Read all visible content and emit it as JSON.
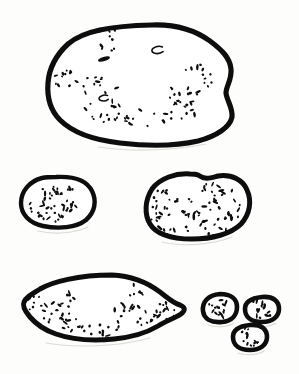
{
  "figure": {
    "background_color": "#fdfdfc",
    "ink_color": "#0d0d0d",
    "fill_color": "#ffffff",
    "shadow_color": "#dedad6",
    "canvas": {
      "width": 299,
      "height": 374
    },
    "rows": [
      {
        "name": "row-top",
        "object_count": 1
      },
      {
        "name": "row-middle",
        "object_count": 2
      },
      {
        "name": "row-bottom",
        "object_count": 4
      }
    ],
    "objects": [
      {
        "id": "object-1",
        "name": "large-rounded-cobble",
        "row": "row-top",
        "stroke_width": 5.2,
        "bbox": {
          "x": 46,
          "y": 22,
          "width": 189,
          "height": 124
        },
        "outline": "M 152 25 C 178 24 196 31 210 41 C 222 50 230 58 231 69 C 232 80 226 86 226 93 C 227 101 233 108 232 117 C 230 127 217 136 198 141 C 176 146 146 146 120 143 C 94 140 72 132 60 120 C 49 109 47 96 48 83 C 49 69 55 56 68 44 C 83 31 110 26 152 25 Z",
        "shadow": "M 98 147 C 130 152 172 151 206 144",
        "pits": [
          {
            "cx": 104,
            "cy": 59,
            "rx": 6.2,
            "ry": 2.1,
            "rot": -16
          },
          {
            "cx": 158,
            "cy": 50,
            "rx": 6.4,
            "ry": 3.4,
            "rot": -8,
            "open": true
          },
          {
            "cx": 104,
            "cy": 98,
            "rx": 5.2,
            "ry": 2.8,
            "rot": -10,
            "open": true
          }
        ],
        "stipple_clusters": [
          {
            "cx": 110,
            "cy": 40,
            "spread_x": 14,
            "spread_y": 12,
            "count": 9,
            "seed": 11
          },
          {
            "cx": 66,
            "cy": 80,
            "spread_x": 12,
            "spread_y": 11,
            "count": 12,
            "seed": 23
          },
          {
            "cx": 96,
            "cy": 85,
            "spread_x": 22,
            "spread_y": 9,
            "count": 11,
            "seed": 37
          },
          {
            "cx": 106,
            "cy": 112,
            "spread_x": 22,
            "spread_y": 12,
            "count": 16,
            "seed": 41
          },
          {
            "cx": 148,
            "cy": 118,
            "spread_x": 24,
            "spread_y": 9,
            "count": 14,
            "seed": 53
          },
          {
            "cx": 186,
            "cy": 110,
            "spread_x": 20,
            "spread_y": 10,
            "count": 13,
            "seed": 67
          },
          {
            "cx": 196,
            "cy": 80,
            "spread_x": 16,
            "spread_y": 16,
            "count": 18,
            "seed": 79
          },
          {
            "cx": 176,
            "cy": 96,
            "spread_x": 12,
            "spread_y": 10,
            "count": 7,
            "seed": 89
          }
        ]
      },
      {
        "id": "object-2",
        "name": "small-oval-left",
        "row": "row-middle",
        "stroke_width": 4.4,
        "bbox": {
          "x": 18,
          "y": 174,
          "width": 78,
          "height": 55
        },
        "outline": "M 56 177 C 74 176 87 181 92 191 C 97 201 95 212 86 220 C 76 228 58 229 43 226 C 29 223 21 214 21 203 C 21 191 30 181 42 178 C 47 177 51 177 56 177 Z",
        "shadow": "M 38 231 C 55 235 75 233 88 227",
        "pits": [],
        "stipple_clusters": [
          {
            "cx": 44,
            "cy": 193,
            "spread_x": 14,
            "spread_y": 7,
            "count": 10,
            "seed": 5
          },
          {
            "cx": 62,
            "cy": 191,
            "spread_x": 12,
            "spread_y": 6,
            "count": 7,
            "seed": 13
          },
          {
            "cx": 42,
            "cy": 208,
            "spread_x": 15,
            "spread_y": 9,
            "count": 13,
            "seed": 29
          },
          {
            "cx": 68,
            "cy": 205,
            "spread_x": 16,
            "spread_y": 10,
            "count": 11,
            "seed": 43
          },
          {
            "cx": 56,
            "cy": 217,
            "spread_x": 16,
            "spread_y": 6,
            "count": 8,
            "seed": 61
          }
        ]
      },
      {
        "id": "object-3",
        "name": "medium-oval-right",
        "row": "row-middle",
        "stroke_width": 5.0,
        "bbox": {
          "x": 143,
          "y": 171,
          "width": 110,
          "height": 72
        },
        "outline": "M 198 175 C 205 180 210 178 218 176 C 232 174 243 180 247 190 C 252 201 250 214 241 224 C 231 234 212 239 192 239 C 172 239 156 234 150 224 C 144 214 145 200 152 189 C 160 178 176 173 190 174 C 194 174 196 174 198 175 Z",
        "shadow": "M 162 242 C 182 247 212 245 232 237",
        "pits": [],
        "stipple_clusters": [
          {
            "cx": 167,
            "cy": 196,
            "spread_x": 14,
            "spread_y": 9,
            "count": 8,
            "seed": 7
          },
          {
            "cx": 158,
            "cy": 212,
            "spread_x": 10,
            "spread_y": 12,
            "count": 9,
            "seed": 17
          },
          {
            "cx": 180,
            "cy": 208,
            "spread_x": 16,
            "spread_y": 12,
            "count": 11,
            "seed": 31
          },
          {
            "cx": 172,
            "cy": 230,
            "spread_x": 16,
            "spread_y": 8,
            "count": 12,
            "seed": 47
          },
          {
            "cx": 216,
            "cy": 192,
            "spread_x": 18,
            "spread_y": 10,
            "count": 14,
            "seed": 59
          },
          {
            "cx": 222,
            "cy": 210,
            "spread_x": 20,
            "spread_y": 13,
            "count": 19,
            "seed": 71
          },
          {
            "cx": 212,
            "cy": 228,
            "spread_x": 16,
            "spread_y": 8,
            "count": 11,
            "seed": 83
          },
          {
            "cx": 196,
            "cy": 218,
            "spread_x": 12,
            "spread_y": 10,
            "count": 7,
            "seed": 97
          }
        ]
      },
      {
        "id": "object-4",
        "name": "elongated-flake",
        "row": "row-bottom",
        "stroke_width": 5.0,
        "bbox": {
          "x": 20,
          "y": 272,
          "width": 168,
          "height": 72
        },
        "outline": "M 112 275 C 134 276 148 283 160 292 C 168 298 173 303 180 305 C 185 307 186 310 181 314 C 175 318 166 321 158 326 C 148 332 134 337 114 339 C 92 341 70 339 56 334 C 44 330 36 324 30 317 C 25 311 22 306 24 302 C 26 297 32 294 40 289 C 52 282 78 275 112 275 Z",
        "shadow": "M 46 343 C 74 348 118 347 150 338",
        "pits": [],
        "stipple_clusters": [
          {
            "cx": 34,
            "cy": 303,
            "spread_x": 9,
            "spread_y": 10,
            "count": 9,
            "seed": 3
          },
          {
            "cx": 52,
            "cy": 312,
            "spread_x": 14,
            "spread_y": 11,
            "count": 12,
            "seed": 19
          },
          {
            "cx": 70,
            "cy": 325,
            "spread_x": 14,
            "spread_y": 8,
            "count": 10,
            "seed": 33
          },
          {
            "cx": 68,
            "cy": 306,
            "spread_x": 9,
            "spread_y": 14,
            "count": 9,
            "seed": 51
          },
          {
            "cx": 100,
            "cy": 330,
            "spread_x": 16,
            "spread_y": 7,
            "count": 10,
            "seed": 63
          },
          {
            "cx": 122,
            "cy": 318,
            "spread_x": 9,
            "spread_y": 16,
            "count": 11,
            "seed": 73
          },
          {
            "cx": 136,
            "cy": 296,
            "spread_x": 7,
            "spread_y": 16,
            "count": 10,
            "seed": 87
          },
          {
            "cx": 146,
            "cy": 320,
            "spread_x": 11,
            "spread_y": 11,
            "count": 10,
            "seed": 101
          },
          {
            "cx": 166,
            "cy": 310,
            "spread_x": 10,
            "spread_y": 11,
            "count": 13,
            "seed": 107
          }
        ]
      },
      {
        "id": "object-5",
        "name": "tiny-round-left",
        "row": "row-bottom",
        "stroke_width": 4.6,
        "bbox": {
          "x": 200,
          "y": 291,
          "width": 40,
          "height": 34
        },
        "outline": "M 220 294 C 231 294 237 299 237 307 C 237 315 232 321 222 322 C 211 323 204 319 203 311 C 202 302 208 295 220 294 Z",
        "shadow": "M 208 325 C 216 328 228 327 234 323",
        "pits": [],
        "stipple_clusters": [
          {
            "cx": 218,
            "cy": 303,
            "spread_x": 9,
            "spread_y": 6,
            "count": 8,
            "seed": 9
          },
          {
            "cx": 218,
            "cy": 313,
            "spread_x": 9,
            "spread_y": 6,
            "count": 9,
            "seed": 27
          }
        ]
      },
      {
        "id": "object-6",
        "name": "tiny-round-upper-right",
        "row": "row-bottom",
        "stroke_width": 4.6,
        "bbox": {
          "x": 242,
          "y": 294,
          "width": 40,
          "height": 32
        },
        "outline": "M 262 297 C 273 296 279 301 279 309 C 279 317 272 322 262 322 C 251 322 245 317 245 309 C 245 301 252 298 262 297 Z",
        "shadow": "M 250 325 C 258 328 270 327 276 323",
        "pits": [],
        "stipple_clusters": [
          {
            "cx": 258,
            "cy": 305,
            "spread_x": 8,
            "spread_y": 5,
            "count": 7,
            "seed": 15
          },
          {
            "cx": 263,
            "cy": 314,
            "spread_x": 9,
            "spread_y": 5,
            "count": 8,
            "seed": 35
          }
        ]
      },
      {
        "id": "object-7",
        "name": "tiny-round-lower-right",
        "row": "row-bottom",
        "stroke_width": 4.6,
        "bbox": {
          "x": 230,
          "y": 322,
          "width": 40,
          "height": 32
        },
        "outline": "M 250 325 C 261 324 267 329 267 337 C 267 345 260 350 250 350 C 239 350 233 345 233 337 C 233 329 240 326 250 325 Z",
        "shadow": "M 238 353 C 246 356 258 355 264 351",
        "pits": [],
        "stipple_clusters": [
          {
            "cx": 246,
            "cy": 333,
            "spread_x": 7,
            "spread_y": 5,
            "count": 6,
            "seed": 21
          },
          {
            "cx": 250,
            "cy": 342,
            "spread_x": 9,
            "spread_y": 5,
            "count": 7,
            "seed": 45
          }
        ]
      }
    ]
  }
}
